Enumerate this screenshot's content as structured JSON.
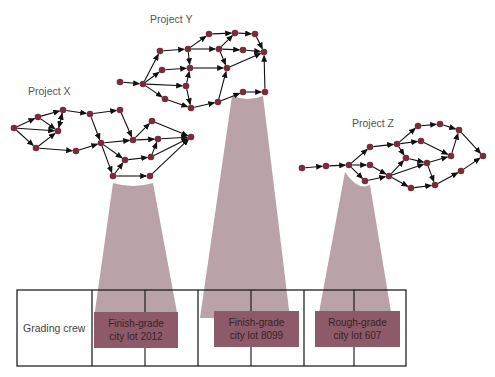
{
  "colors": {
    "node": "#7a2c3c",
    "arrow": "#111111",
    "beam": "#b9a3a8",
    "task_fill": "#8c5a68",
    "grid_line": "#111111"
  },
  "projects": [
    {
      "label": "Project X",
      "label_pos": [
        28,
        95
      ],
      "beam": {
        "top_left": [
          113,
          183
        ],
        "top_right": [
          153,
          183
        ],
        "bottom_left": [
          94,
          318
        ],
        "bottom_right": [
          178,
          318
        ]
      },
      "nodes": {
        "A": [
          14,
          128
        ],
        "B": [
          38,
          117
        ],
        "C": [
          63,
          110
        ],
        "D": [
          58,
          131
        ],
        "E": [
          36,
          148
        ],
        "F": [
          90,
          114
        ],
        "G": [
          120,
          110
        ],
        "H": [
          76,
          151
        ],
        "I": [
          101,
          143
        ],
        "J": [
          133,
          140
        ],
        "K": [
          152,
          121
        ],
        "L": [
          158,
          139
        ],
        "M": [
          191,
          137
        ],
        "N": [
          125,
          160
        ],
        "O": [
          151,
          157
        ],
        "P": [
          113,
          176
        ],
        "Q": [
          150,
          176
        ]
      },
      "edges": [
        [
          "A",
          "B"
        ],
        [
          "A",
          "D"
        ],
        [
          "A",
          "E"
        ],
        [
          "B",
          "C"
        ],
        [
          "B",
          "D"
        ],
        [
          "C",
          "D"
        ],
        [
          "D",
          "C"
        ],
        [
          "C",
          "F"
        ],
        [
          "E",
          "D"
        ],
        [
          "E",
          "H"
        ],
        [
          "F",
          "G"
        ],
        [
          "F",
          "I"
        ],
        [
          "G",
          "J"
        ],
        [
          "H",
          "I"
        ],
        [
          "I",
          "J"
        ],
        [
          "I",
          "N"
        ],
        [
          "I",
          "P"
        ],
        [
          "J",
          "K"
        ],
        [
          "J",
          "L"
        ],
        [
          "K",
          "M"
        ],
        [
          "L",
          "M"
        ],
        [
          "N",
          "O"
        ],
        [
          "O",
          "L"
        ],
        [
          "O",
          "M"
        ],
        [
          "P",
          "Q"
        ],
        [
          "Q",
          "M"
        ],
        [
          "P",
          "N"
        ]
      ]
    },
    {
      "label": "Project Y",
      "label_pos": [
        150,
        16
      ],
      "beam": {
        "top_left": [
          232,
          96
        ],
        "top_right": [
          263,
          96
        ],
        "bottom_left": [
          200,
          318
        ],
        "bottom_right": [
          290,
          318
        ]
      },
      "nodes": {
        "a": [
          120,
          82
        ],
        "b": [
          143,
          84
        ],
        "c": [
          160,
          51
        ],
        "d": [
          188,
          49
        ],
        "e": [
          209,
          34
        ],
        "f": [
          235,
          33
        ],
        "g": [
          255,
          34
        ],
        "h": [
          219,
          49
        ],
        "i": [
          243,
          50
        ],
        "j": [
          264,
          52
        ],
        "k": [
          162,
          70
        ],
        "l": [
          190,
          68
        ],
        "m": [
          227,
          68
        ],
        "n": [
          186,
          86
        ],
        "o": [
          165,
          99
        ],
        "p": [
          191,
          108
        ],
        "q": [
          218,
          102
        ],
        "r": [
          243,
          92
        ],
        "s": [
          265,
          92
        ]
      },
      "edges": [
        [
          "a",
          "b"
        ],
        [
          "b",
          "c"
        ],
        [
          "b",
          "k"
        ],
        [
          "b",
          "n"
        ],
        [
          "b",
          "o"
        ],
        [
          "c",
          "d"
        ],
        [
          "d",
          "e"
        ],
        [
          "d",
          "h"
        ],
        [
          "d",
          "l"
        ],
        [
          "e",
          "f"
        ],
        [
          "f",
          "g"
        ],
        [
          "g",
          "j"
        ],
        [
          "h",
          "f"
        ],
        [
          "h",
          "i"
        ],
        [
          "h",
          "m"
        ],
        [
          "i",
          "j"
        ],
        [
          "k",
          "l"
        ],
        [
          "l",
          "m"
        ],
        [
          "m",
          "j"
        ],
        [
          "n",
          "l"
        ],
        [
          "n",
          "p"
        ],
        [
          "o",
          "p"
        ],
        [
          "p",
          "q"
        ],
        [
          "q",
          "m"
        ],
        [
          "q",
          "r"
        ],
        [
          "r",
          "s"
        ],
        [
          "s",
          "j"
        ]
      ]
    },
    {
      "label": "Project Z",
      "label_pos": [
        352,
        120
      ],
      "beam": {
        "top_left": [
          345,
          172
        ],
        "top_right": [
          370,
          185
        ],
        "bottom_left": [
          318,
          318
        ],
        "bottom_right": [
          392,
          318
        ]
      },
      "nodes": {
        "z1": [
          302,
          168
        ],
        "z2": [
          326,
          166
        ],
        "z3": [
          349,
          165
        ],
        "z4": [
          370,
          147
        ],
        "z5": [
          397,
          144
        ],
        "z6": [
          370,
          165
        ],
        "z7": [
          365,
          181
        ],
        "z8": [
          389,
          176
        ],
        "z9": [
          406,
          158
        ],
        "z10": [
          427,
          163
        ],
        "z12": [
          418,
          126
        ],
        "z13": [
          421,
          141
        ],
        "z14": [
          440,
          124
        ],
        "z15": [
          459,
          130
        ],
        "z16": [
          451,
          156
        ],
        "z17": [
          411,
          188
        ],
        "z18": [
          435,
          185
        ],
        "z19": [
          461,
          171
        ],
        "z20": [
          483,
          156
        ]
      },
      "edges": [
        [
          "z1",
          "z2"
        ],
        [
          "z2",
          "z3"
        ],
        [
          "z3",
          "z4"
        ],
        [
          "z3",
          "z6"
        ],
        [
          "z3",
          "z7"
        ],
        [
          "z4",
          "z5"
        ],
        [
          "z5",
          "z12"
        ],
        [
          "z5",
          "z13"
        ],
        [
          "z5",
          "z9"
        ],
        [
          "z6",
          "z8"
        ],
        [
          "z7",
          "z8"
        ],
        [
          "z8",
          "z9"
        ],
        [
          "z8",
          "z10"
        ],
        [
          "z8",
          "z17"
        ],
        [
          "z9",
          "z10"
        ],
        [
          "z10",
          "z18"
        ],
        [
          "z12",
          "z14"
        ],
        [
          "z14",
          "z15"
        ],
        [
          "z13",
          "z16"
        ],
        [
          "z16",
          "z15"
        ],
        [
          "z15",
          "z20"
        ],
        [
          "z17",
          "z18"
        ],
        [
          "z18",
          "z19"
        ],
        [
          "z19",
          "z20"
        ],
        [
          "z10",
          "z16"
        ]
      ]
    }
  ],
  "schedule": {
    "row_label": "Grading crew",
    "tasks": [
      {
        "line1": "Finish-grade",
        "line2": "city lot 2012"
      },
      {
        "line1": "Finish-grade",
        "line2": "city lot 8099"
      },
      {
        "line1": "Rough-grade",
        "line2": "city lot 607"
      }
    ]
  }
}
